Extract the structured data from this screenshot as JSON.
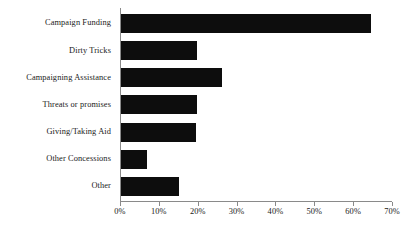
{
  "chart_data": {
    "type": "bar",
    "orientation": "horizontal",
    "title": "",
    "subtitle": "",
    "xlabel": "",
    "ylabel": "",
    "categories": [
      "Campaign Funding",
      "Dirty Tricks",
      "Campaigning Assistance",
      "Threats or promises",
      "Giving/Taking Aid",
      "Other Concessions",
      "Other"
    ],
    "values": [
      64.6,
      19.8,
      26.2,
      19.8,
      19.6,
      7.0,
      15.2
    ],
    "value_unit": "%",
    "xlim": [
      0,
      70
    ],
    "xticks": [
      0,
      10,
      20,
      30,
      40,
      50,
      60,
      70
    ],
    "xtick_labels": [
      "0%",
      "10%",
      "20%",
      "30%",
      "40%",
      "50%",
      "60%",
      "70%"
    ],
    "grid": false,
    "legend": null,
    "legend_position": "none",
    "bar_color": "#0d0d0d",
    "axis_color": "#8a8a8a",
    "background_color": "#ffffff"
  }
}
